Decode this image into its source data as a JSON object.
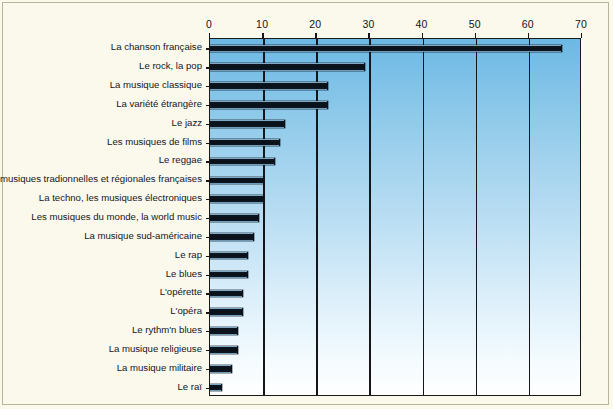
{
  "chart_data": {
    "type": "bar",
    "orientation": "horizontal",
    "title": "",
    "xlabel": "",
    "ylabel": "",
    "xlim": [
      0,
      70
    ],
    "xticks": [
      0,
      10,
      20,
      30,
      40,
      50,
      60,
      70
    ],
    "xtick_labels": [
      "0",
      "10",
      "20",
      "30",
      "40",
      "50",
      "60",
      "70"
    ],
    "grid": true,
    "grid_axis": "x",
    "legend": false,
    "categories": [
      "La chanson française",
      "Le rock, la pop",
      "La musique classique",
      "La variété étrangère",
      "Le jazz",
      "Les musiques de films",
      "Le reggae",
      "Les musiques tradionnelles et régionales françaises",
      "La techno, les musiques électroniques",
      "Les musiques du monde, la world music",
      "La musique sud-américaine",
      "Le rap",
      "Le blues",
      "L'opérette",
      "L'opéra",
      "Le rythm'n blues",
      "La musique religieuse",
      "La musique militaire",
      "Le raï"
    ],
    "values": [
      66,
      29,
      22,
      22,
      14,
      13,
      12,
      10,
      10,
      9,
      8,
      7,
      7,
      6,
      6,
      5,
      5,
      4,
      2
    ],
    "colors": {
      "bar_fill": "#0a1018",
      "bar_bevel": "#7fa8c4",
      "plot_top": "#6cb8e4",
      "plot_bottom": "#ffffff",
      "page_background": "#fbf9ec",
      "axis": "#15151a",
      "text": "#14141c"
    }
  }
}
